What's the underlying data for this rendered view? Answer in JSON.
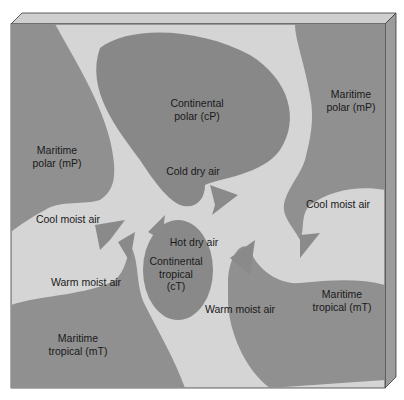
{
  "diagram": {
    "colors": {
      "background": "#ffffff",
      "map_light": "#d6d6d6",
      "air_mass_dark": "#8f8f8f",
      "continental_polar": "#8a8a8a",
      "slab_top": "#c9c9c9",
      "slab_side": "#9a9a9a",
      "outline": "#3a3a3a",
      "text": "#1a1a1a"
    },
    "air_masses": [
      {
        "id": "mP-west",
        "line1": "Maritime",
        "line2": "polar (mP)"
      },
      {
        "id": "cP",
        "line1": "Continental",
        "line2": "polar (cP)"
      },
      {
        "id": "mP-east",
        "line1": "Maritime",
        "line2": "polar (mP)"
      },
      {
        "id": "cT",
        "line1": "Continental",
        "line2": "tropical",
        "line3": "(cT)"
      },
      {
        "id": "mT-west",
        "line1": "Maritime",
        "line2": "tropical (mT)"
      },
      {
        "id": "mT-east",
        "line1": "Maritime",
        "line2": "tropical (mT)"
      }
    ],
    "flow_labels": {
      "cold_dry": "Cold dry air",
      "cool_moist_west": "Cool moist air",
      "cool_moist_east": "Cool moist air",
      "hot_dry": "Hot dry air",
      "warm_moist_west": "Warm moist air",
      "warm_moist_east": "Warm moist air"
    }
  }
}
